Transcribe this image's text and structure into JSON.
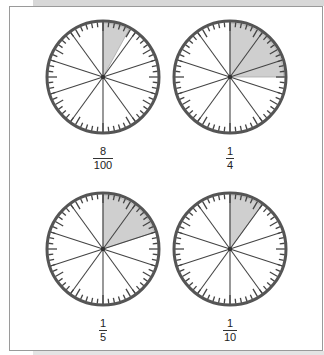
{
  "colors": {
    "shade": "#cfcfcf",
    "outline": "#555555",
    "lines": "#444444"
  },
  "clocks": [
    {
      "label": {
        "numerator": "8",
        "denominator": "100"
      },
      "fraction": 0.08,
      "sectors": 10
    },
    {
      "label": {
        "numerator": "1",
        "denominator": "4"
      },
      "fraction": 0.25,
      "sectors": 10
    },
    {
      "label": {
        "numerator": "1",
        "denominator": "5"
      },
      "fraction": 0.2,
      "sectors": 10
    },
    {
      "label": {
        "numerator": "1",
        "denominator": "10"
      },
      "fraction": 0.1,
      "sectors": 10
    }
  ]
}
